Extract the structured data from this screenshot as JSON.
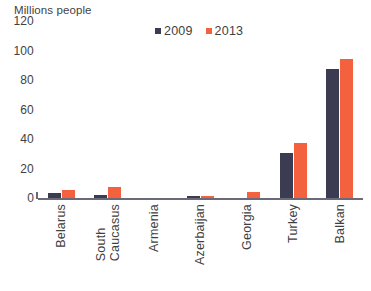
{
  "chart": {
    "title": "Millions people",
    "axis_baseline_name": "x-axis-line"
  },
  "legend": {
    "position": "top-center",
    "items": [
      {
        "label": "2009",
        "color": "#3b3b52"
      },
      {
        "label": "2013",
        "color": "#f4613e"
      }
    ]
  },
  "chart_data": {
    "type": "bar",
    "title": "Millions people",
    "xlabel": "",
    "ylabel": "Millions people",
    "ylim": [
      0,
      120
    ],
    "yticks": [
      0,
      20,
      40,
      60,
      80,
      100,
      120
    ],
    "ytick_labels": [
      "0",
      "20",
      "40",
      "60",
      "80",
      "100",
      "120"
    ],
    "grid": false,
    "legend_position": "top-center",
    "categories": [
      "Belarus",
      "South Caucasus",
      "Armenia",
      "Azerbaijan",
      "Georgia",
      "Turkey",
      "Balkan"
    ],
    "category_lines": [
      [
        "Belarus"
      ],
      [
        "South",
        "Caucasus"
      ],
      [
        "Armenia"
      ],
      [
        "Azerbaijan"
      ],
      [
        "Georgia"
      ],
      [
        "Turkey"
      ],
      [
        "Balkan"
      ]
    ],
    "series": [
      {
        "name": "2009",
        "color": "#3b3b52",
        "values": [
          4,
          3,
          1,
          2,
          1,
          31,
          88
        ]
      },
      {
        "name": "2013",
        "color": "#f4613e",
        "values": [
          6,
          8,
          1,
          2,
          5,
          38,
          95
        ]
      }
    ]
  }
}
